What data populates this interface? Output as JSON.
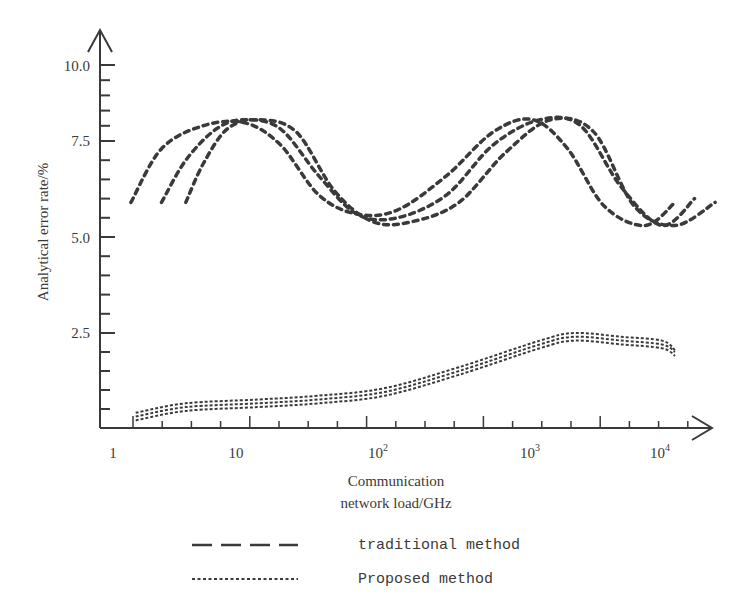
{
  "chart_data": {
    "type": "line",
    "title": "",
    "xlabel": "Communication network load/GHz",
    "xlabel_lines": [
      "Communication",
      "network load/GHz"
    ],
    "ylabel": "Analytical error rate/%",
    "x_scale": "log",
    "xlim": [
      1,
      20000
    ],
    "ylim": [
      0,
      10.5
    ],
    "x_tick_labels": [
      "1",
      "10",
      "10^2",
      "10^3",
      "10^4"
    ],
    "y_tick_labels": [
      "2.5",
      "5.0",
      "7.5",
      "10.0"
    ],
    "grid": false,
    "legend_position": "bottom",
    "series": [
      {
        "name": "traditional method",
        "style": "dashed",
        "group": "traditional-1",
        "x": [
          1.2,
          2,
          4,
          8,
          15,
          30,
          60,
          120,
          250,
          500,
          900,
          1600,
          3000,
          6000,
          10000
        ],
        "y": [
          5.9,
          7.3,
          8.0,
          8.1,
          7.4,
          6.1,
          5.6,
          5.7,
          6.6,
          7.8,
          8.2,
          7.3,
          5.8,
          5.3,
          5.9
        ]
      },
      {
        "name": "traditional method",
        "style": "dashed",
        "group": "traditional-2",
        "x": [
          2,
          3,
          5,
          8,
          15,
          30,
          60,
          120,
          250,
          500,
          1000,
          2000,
          4000,
          8000,
          14000
        ],
        "y": [
          5.9,
          7.0,
          7.9,
          8.2,
          7.9,
          6.6,
          5.6,
          5.5,
          6.1,
          7.4,
          8.2,
          8.0,
          6.3,
          5.3,
          6.0
        ]
      },
      {
        "name": "traditional method",
        "style": "dashed",
        "group": "traditional-3",
        "x": [
          3,
          4,
          6,
          10,
          20,
          40,
          80,
          150,
          300,
          600,
          1200,
          2500,
          5000,
          10000,
          20000
        ],
        "y": [
          5.9,
          6.9,
          7.9,
          8.2,
          7.8,
          6.2,
          5.4,
          5.4,
          5.9,
          7.2,
          8.2,
          7.8,
          5.8,
          5.3,
          5.9
        ]
      },
      {
        "name": "Proposed method",
        "style": "dotted",
        "group": "proposed-1",
        "x": [
          1.3,
          3,
          10,
          30,
          100,
          300,
          1000,
          1800,
          4000,
          8000,
          10000
        ],
        "y": [
          0.4,
          0.65,
          0.75,
          0.85,
          1.05,
          1.6,
          2.3,
          2.5,
          2.4,
          2.3,
          2.05
        ]
      },
      {
        "name": "Proposed method",
        "style": "dotted",
        "group": "proposed-2",
        "x": [
          1.3,
          3,
          10,
          30,
          100,
          300,
          1000,
          1800,
          4000,
          8000,
          10000
        ],
        "y": [
          0.3,
          0.55,
          0.65,
          0.75,
          0.95,
          1.5,
          2.2,
          2.4,
          2.3,
          2.2,
          2.0
        ]
      },
      {
        "name": "Proposed method",
        "style": "dotted",
        "group": "proposed-3",
        "x": [
          1.3,
          3,
          10,
          30,
          100,
          300,
          1000,
          1800,
          4000,
          8000,
          10000
        ],
        "y": [
          0.2,
          0.45,
          0.55,
          0.65,
          0.85,
          1.4,
          2.1,
          2.3,
          2.2,
          2.1,
          1.9
        ]
      }
    ],
    "legend": [
      {
        "label": "traditional method",
        "style": "dashed"
      },
      {
        "label": "Proposed method",
        "style": "dotted"
      }
    ]
  },
  "axis": {
    "y_title": "Analytical error rate/%",
    "x_title_line1": "Communication",
    "x_title_line2": "network load/GHz",
    "x_labels": [
      {
        "base": "1",
        "exp": ""
      },
      {
        "base": "10",
        "exp": ""
      },
      {
        "base": "10",
        "exp": "2"
      },
      {
        "base": "10",
        "exp": "3"
      },
      {
        "base": "10",
        "exp": "4"
      }
    ],
    "y_labels": [
      "10.0",
      "7.5",
      "5.0",
      "2.5"
    ]
  },
  "legend": {
    "traditional_label": "traditional method",
    "proposed_label": "Proposed method"
  },
  "colors": {
    "ink": "#3a3a3a",
    "background": "#ffffff"
  }
}
